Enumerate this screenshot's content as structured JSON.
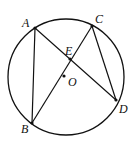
{
  "diagram": {
    "type": "circle-geometry",
    "circle": {
      "center": "O",
      "cx": 66,
      "cy": 77,
      "r": 58
    },
    "points": {
      "A": {
        "label": "A",
        "x": 35,
        "y": 28,
        "lx": 22,
        "ly": 27
      },
      "B": {
        "label": "B",
        "x": 32,
        "y": 123,
        "lx": 21,
        "ly": 133
      },
      "C": {
        "label": "C",
        "x": 92,
        "y": 26,
        "lx": 95,
        "ly": 23
      },
      "D": {
        "label": "D",
        "x": 116,
        "y": 100,
        "lx": 119,
        "ly": 113
      },
      "E": {
        "label": "E",
        "x": 70,
        "y": 59,
        "lx": 65,
        "ly": 55
      },
      "O": {
        "label": "O",
        "x": 64,
        "y": 76,
        "lx": 68,
        "ly": 86
      }
    },
    "segments": [
      "AB",
      "AD",
      "BC",
      "CD"
    ]
  }
}
